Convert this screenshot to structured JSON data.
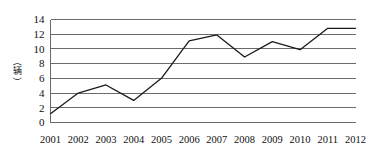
{
  "chart_data": {
    "type": "line",
    "title": "",
    "subtitle": "",
    "xlabel": "",
    "ylabel": "（辆）",
    "categories": [
      "2001",
      "2002",
      "2003",
      "2004",
      "2005",
      "2006",
      "2007",
      "2008",
      "2009",
      "2010",
      "2011",
      "2012"
    ],
    "series": [
      {
        "name": "",
        "values": [
          1.2,
          4.0,
          5.1,
          3.0,
          6.0,
          11.1,
          11.9,
          8.9,
          11.0,
          9.9,
          12.8,
          12.8
        ]
      }
    ],
    "ylim": [
      0,
      14
    ],
    "xlim": [
      "2001",
      "2012"
    ],
    "y_ticks": [
      "0",
      "2",
      "4",
      "6",
      "8",
      "10",
      "12",
      "14"
    ],
    "y_tick_values": [
      0,
      2,
      4,
      6,
      8,
      10,
      12,
      14
    ],
    "grid": true,
    "grid_orientation": "horizontal",
    "legend": false,
    "legend_position": "none",
    "colors": {
      "series_line": "#1a1a1a",
      "gridline": "#6b6b6b",
      "axis": "#6b6b6b",
      "background": "#ffffff",
      "text": "#111111"
    }
  }
}
